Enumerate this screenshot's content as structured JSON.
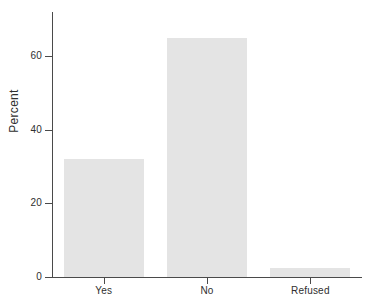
{
  "chart_data": {
    "type": "bar",
    "title": "",
    "subtitle": "",
    "xlabel": "",
    "ylabel": "Percent",
    "categories": [
      "Yes",
      "No",
      "Refused"
    ],
    "values": [
      32,
      65,
      2.5
    ],
    "series": [
      {
        "name": "Percent",
        "values": [
          32,
          65,
          2.5
        ]
      }
    ],
    "ylim": [
      0,
      72
    ],
    "xlim": [
      0,
      3
    ],
    "yticks": [
      0,
      20,
      40,
      60
    ],
    "ytick_labels": [
      "0",
      "20",
      "40",
      "60"
    ],
    "xtick_labels": [
      "Yes",
      "No",
      "Refused"
    ],
    "grid": false,
    "legend": null,
    "legend_position": "none",
    "annotations": [],
    "colors": {
      "bar_fill": "#e4e4e4",
      "axis": "#4a4a4a",
      "text": "#2f2f2f",
      "background": "#ffffff"
    }
  }
}
